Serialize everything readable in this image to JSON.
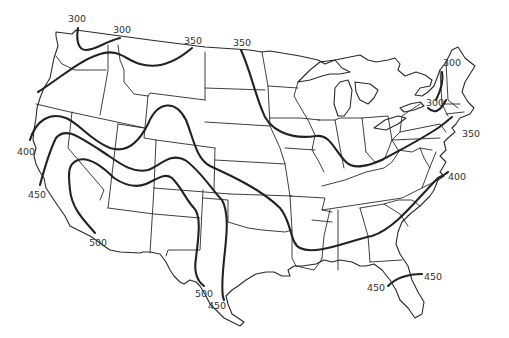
{
  "map": {
    "subject": "Contiguous United States with isolines",
    "line_color": "#222222",
    "background": "#ffffff",
    "contours": [
      {
        "id": "300-west",
        "value": "300",
        "label_pos": [
          68,
          14
        ]
      },
      {
        "id": "300-west-b",
        "value": "300",
        "label_pos": [
          113,
          24
        ]
      },
      {
        "id": "350-west",
        "value": "350",
        "label_pos": [
          184,
          35
        ]
      },
      {
        "id": "350-north",
        "value": "350",
        "label_pos": [
          233,
          37
        ]
      },
      {
        "id": "300-ne",
        "value": "300",
        "label_pos": [
          443,
          57
        ]
      },
      {
        "id": "300-ne-b",
        "value": "300",
        "label_pos": [
          426,
          97
        ]
      },
      {
        "id": "350-ne",
        "value": "350",
        "label_pos": [
          462,
          128
        ]
      },
      {
        "id": "400-west",
        "value": "400",
        "label_pos": [
          17,
          146
        ]
      },
      {
        "id": "400-east",
        "value": "400",
        "label_pos": [
          448,
          172
        ]
      },
      {
        "id": "450-west",
        "value": "450",
        "label_pos": [
          28,
          190
        ]
      },
      {
        "id": "500-west",
        "value": "500",
        "label_pos": [
          89,
          238
        ]
      },
      {
        "id": "500-texas",
        "value": "500",
        "label_pos": [
          195,
          288
        ]
      },
      {
        "id": "450-texas",
        "value": "450",
        "label_pos": [
          208,
          301
        ]
      },
      {
        "id": "450-florida-w",
        "value": "450",
        "label_pos": [
          367,
          282
        ]
      },
      {
        "id": "450-florida-e",
        "value": "450",
        "label_pos": [
          424,
          272
        ]
      }
    ]
  }
}
